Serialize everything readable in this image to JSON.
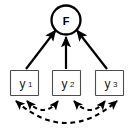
{
  "diagram": {
    "type": "sem-path-diagram",
    "background_color": "#ffffff",
    "stroke_color": "#000000",
    "box_border_color": "#4d4d4d",
    "box_fill_color": "#ffffff"
  },
  "latent_factor": {
    "id": "F",
    "label": "F",
    "shape": "circle",
    "cx": 66,
    "cy": 20,
    "r": 14.5,
    "stroke_width": 2.2
  },
  "indicators": [
    {
      "id": "y1",
      "label": "y",
      "subscript": "1",
      "shape": "rectangle",
      "x": 10,
      "y": 70,
      "width": 28,
      "height": 26
    },
    {
      "id": "y2",
      "label": "y",
      "subscript": "2",
      "shape": "rectangle",
      "x": 52,
      "y": 70,
      "width": 28,
      "height": 26
    },
    {
      "id": "y3",
      "label": "y",
      "subscript": "3",
      "shape": "rectangle",
      "x": 95,
      "y": 70,
      "width": 28,
      "height": 26
    }
  ],
  "loading_paths": [
    {
      "id": "path-y1-F",
      "from": "y1",
      "to": "F",
      "style": "solid",
      "arrow": "single",
      "label": ""
    },
    {
      "id": "path-y2-F",
      "from": "y2",
      "to": "F",
      "style": "solid",
      "arrow": "single",
      "label": ""
    },
    {
      "id": "path-y3-F",
      "from": "y3",
      "to": "F",
      "style": "solid",
      "arrow": "single",
      "label": ""
    }
  ],
  "correlation_paths": [
    {
      "id": "corr-y1-y2",
      "from": "y1",
      "to": "y2",
      "style": "dashed",
      "arrow": "double",
      "label": ""
    },
    {
      "id": "corr-y2-y3",
      "from": "y2",
      "to": "y3",
      "style": "dashed",
      "arrow": "double",
      "label": ""
    },
    {
      "id": "corr-y1-y3",
      "from": "y1",
      "to": "y3",
      "style": "dashed",
      "arrow": "double",
      "label": ""
    }
  ]
}
